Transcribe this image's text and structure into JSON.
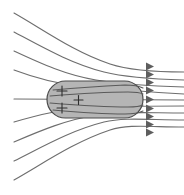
{
  "figure": {
    "background_color": "#ffffff",
    "width": 184,
    "height": 195
  },
  "conductor": {
    "label": "charged-conductor",
    "shape": "capsule",
    "fill_color": "#b5b5b5",
    "stroke_color": "#4a4a4a",
    "x": 47,
    "y": 81,
    "width": 96,
    "height": 37,
    "corner_radius": 18.5,
    "charges": [
      {
        "symbol": "+",
        "x": 62,
        "y": 91
      },
      {
        "symbol": "+",
        "x": 62,
        "y": 108
      },
      {
        "symbol": "+",
        "x": 78,
        "y": 100
      }
    ]
  },
  "field": {
    "label": "electric-field-lines",
    "stroke_color": "#6e6e6e",
    "direction": "inward-from-right",
    "line_count": 9,
    "arrowhead_color": "#5e5e5e",
    "arrowhead_count": 9,
    "left_entry_y": [
      13,
      32,
      51,
      70,
      99,
      122,
      142,
      161,
      180
    ],
    "right_entry_y": [
      66,
      74,
      82,
      90,
      99,
      108,
      116,
      124,
      132
    ],
    "arrowhead_x": [
      150,
      150,
      150,
      150,
      150,
      150,
      150,
      150,
      150
    ],
    "lines": [
      {
        "name": "field-line-top-1",
        "path": "M 14,13 C 44,30 74,52 110,64 C 128,70 150,72 184,72",
        "has_arrow": true,
        "arrow_x": 151,
        "arrow_y": 66
      },
      {
        "name": "field-line-top-2",
        "path": "M 14,32 C 44,48 72,64 104,72 C 124,77 150,79 184,80",
        "has_arrow": true,
        "arrow_x": 151,
        "arrow_y": 74
      },
      {
        "name": "field-line-top-3",
        "path": "M 14,51 C 42,64 66,75 96,80 C 120,84 150,86 184,87",
        "has_arrow": true,
        "arrow_x": 151,
        "arrow_y": 82
      },
      {
        "name": "field-line-top-4",
        "path": "M 14,70 C 38,79 58,84 80,86 C 112,89 150,92 184,94",
        "has_arrow": true,
        "arrow_x": 151,
        "arrow_y": 90
      },
      {
        "name": "field-line-axis",
        "path": "M 14,99 L 184,100",
        "has_arrow": true,
        "arrow_x": 151,
        "arrow_y": 99
      },
      {
        "name": "field-line-bottom-4",
        "path": "M 14,122 C 38,115 58,110 80,108 C 112,106 150,106 184,106",
        "has_arrow": true,
        "arrow_x": 151,
        "arrow_y": 108
      },
      {
        "name": "field-line-bottom-3",
        "path": "M 14,142 C 42,130 66,120 96,115 C 120,111 150,113 184,113",
        "has_arrow": true,
        "arrow_x": 151,
        "arrow_y": 116
      },
      {
        "name": "field-line-bottom-2",
        "path": "M 14,161 C 44,146 72,130 104,122 C 124,117 150,120 184,120",
        "has_arrow": true,
        "arrow_x": 151,
        "arrow_y": 124
      },
      {
        "name": "field-line-bottom-1",
        "path": "M 14,180 C 44,163 74,142 110,130 C 128,124 150,127 184,127",
        "has_arrow": true,
        "arrow_x": 151,
        "arrow_y": 132
      }
    ],
    "inner_lines": [
      {
        "name": "field-line-inner-top-1",
        "path": "M 53,90 C 75,88 105,86 125,85 C 134,85 139,86 143,88"
      },
      {
        "name": "field-line-inner-top-2",
        "path": "M 50,96 C 75,94 108,92 128,92 C 136,92 141,93 143,94"
      },
      {
        "name": "field-line-inner-bottom-2",
        "path": "M 50,103 C 75,105 108,107 128,107 C 136,107 141,106 143,105"
      },
      {
        "name": "field-line-inner-bottom-1",
        "path": "M 53,110 C 75,112 105,114 125,114 C 134,114 139,113 143,111"
      }
    ]
  }
}
